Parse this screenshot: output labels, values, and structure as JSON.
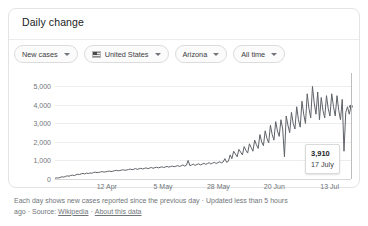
{
  "card": {
    "title": "Daily change"
  },
  "filters": [
    {
      "label": "New cases",
      "icon": "chevron-down-icon",
      "name": "metric"
    },
    {
      "label": "United States",
      "icon": "us-flag-icon",
      "name": "country"
    },
    {
      "label": "Arizona",
      "icon": "chevron-down-icon",
      "name": "region"
    },
    {
      "label": "All time",
      "icon": "chevron-down-icon",
      "name": "timerange"
    }
  ],
  "tooltip": {
    "value": "3,910",
    "date": "17 July"
  },
  "footer": {
    "description": "Each day shows new cases reported since the previous day",
    "updated": "Updated less than 5 hours ago",
    "source_label": "Source:",
    "source_link": "Wikipedia",
    "about_link": "About this data",
    "separator": "·"
  },
  "chart_data": {
    "type": "line",
    "title": "Daily change",
    "xlabel": "",
    "ylabel": "",
    "ylim": [
      0,
      5400
    ],
    "yticks": [
      0,
      1000,
      2000,
      3000,
      4000,
      5000
    ],
    "ytick_labels": [
      "0",
      "1,000",
      "2,000",
      "3,000",
      "4,000",
      "5,000"
    ],
    "xticks": [
      "12 Apr",
      "5 May",
      "28 May",
      "20 Jun",
      "13 Jul"
    ],
    "xtick_positions": [
      0.175,
      0.365,
      0.552,
      0.741,
      0.928
    ],
    "grid": true,
    "legend": false,
    "line_color": "#5f6368",
    "highlight": {
      "x_label": "17 July",
      "y": 3910
    },
    "series": [
      {
        "name": "New cases",
        "values": [
          40,
          60,
          55,
          90,
          120,
          100,
          140,
          170,
          150,
          190,
          210,
          180,
          230,
          260,
          240,
          280,
          300,
          270,
          320,
          290,
          330,
          310,
          350,
          370,
          340,
          360,
          380,
          400,
          370,
          390,
          410,
          430,
          400,
          420,
          450,
          470,
          440,
          460,
          480,
          500,
          470,
          490,
          510,
          540,
          500,
          530,
          560,
          520,
          550,
          580,
          540,
          570,
          600,
          560,
          590,
          620,
          580,
          610,
          640,
          600,
          630,
          660,
          620,
          650,
          680,
          640,
          670,
          700,
          660,
          690,
          720,
          680,
          710,
          760,
          700,
          740,
          1000,
          720,
          760,
          800,
          740,
          780,
          820,
          760,
          800,
          850,
          790,
          830,
          880,
          810,
          860,
          900,
          840,
          880,
          930,
          870,
          920,
          1100,
          900,
          960,
          1300,
          1100,
          1500,
          1350,
          1200,
          1600,
          1450,
          1300,
          1750,
          1550,
          1400,
          1900,
          1700,
          1500,
          2100,
          1850,
          1650,
          2400,
          2000,
          1800,
          2600,
          2200,
          1950,
          2900,
          2400,
          2100,
          3100,
          2600,
          2300,
          3200,
          2700,
          1200,
          3400,
          2900,
          2500,
          3600,
          3000,
          2700,
          3900,
          3200,
          2800,
          4200,
          3500,
          3000,
          4600,
          3800,
          3300,
          5000,
          4100,
          3500,
          4700,
          3200,
          4400,
          3700,
          3300,
          4500,
          3800,
          3400,
          4600,
          3900,
          3400,
          4500,
          3700,
          3200,
          4300,
          1500,
          3600,
          3900,
          3500,
          3910
        ]
      }
    ]
  }
}
